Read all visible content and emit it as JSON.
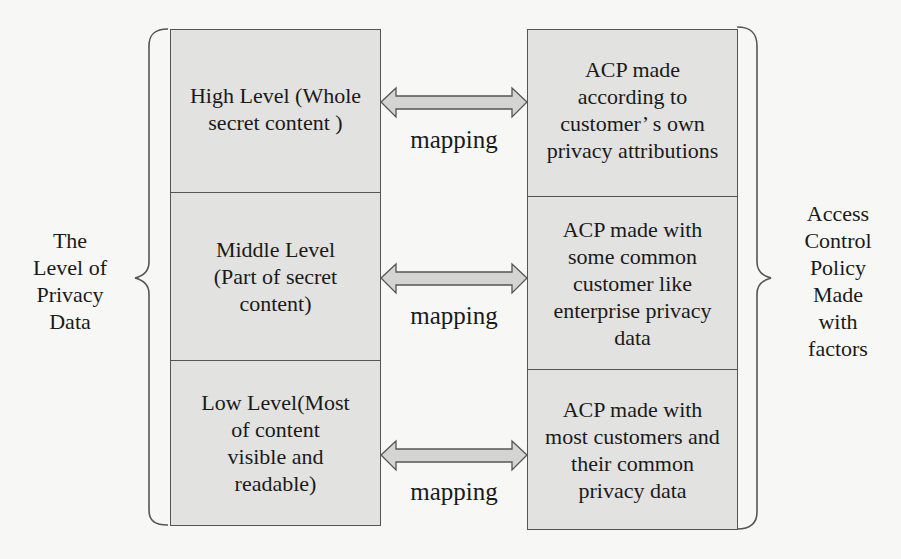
{
  "left_label": [
    "The",
    "Level of",
    "Privacy",
    "Data"
  ],
  "right_label": [
    "Access",
    "Control",
    "Policy",
    "Made",
    "with",
    "factors"
  ],
  "levels": [
    {
      "lines": [
        "High Level (Whole",
        "secret content )"
      ]
    },
    {
      "lines": [
        "Middle Level",
        "(Part of secret",
        "content)"
      ]
    },
    {
      "lines": [
        "Low Level(Most",
        "of content",
        "visible and",
        "readable)"
      ]
    }
  ],
  "policies": [
    {
      "lines": [
        "ACP made",
        "according to",
        "customer’ s own",
        "privacy attributions"
      ]
    },
    {
      "lines": [
        "ACP made with",
        "some common",
        "customer like",
        "enterprise privacy",
        "data"
      ]
    },
    {
      "lines": [
        "ACP made with",
        "most customers and",
        "their common",
        "privacy data"
      ]
    }
  ],
  "mappings": [
    "mapping",
    "mapping",
    "mapping"
  ],
  "colors": {
    "box_fill": "#e2e2e0",
    "border": "#555555",
    "arrow_fill": "#d4d4d2"
  }
}
